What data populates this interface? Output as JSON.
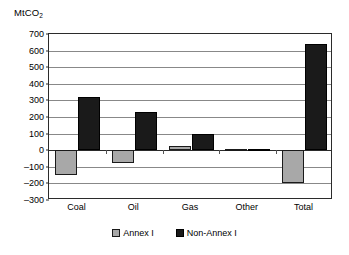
{
  "chart_data": {
    "type": "bar",
    "title": "",
    "subtitle": "",
    "xlabel": "",
    "ylabel": "MtCO2",
    "ylabel_prefix": "MtCO",
    "ylabel_sub": "2",
    "categories": [
      "Coal",
      "Oil",
      "Gas",
      "Other",
      "Total"
    ],
    "series": [
      {
        "name": "Annex I",
        "color": "#a8a8a8",
        "values": [
          -150,
          -75,
          25,
          5,
          -200
        ]
      },
      {
        "name": "Non-Annex I",
        "color": "#1a1a1a",
        "values": [
          320,
          230,
          95,
          5,
          640
        ]
      }
    ],
    "ylim": [
      -300,
      700
    ],
    "ytick_values": [
      700,
      600,
      500,
      400,
      300,
      200,
      100,
      0,
      -100,
      -200,
      -300
    ],
    "ytick_labels": [
      "700",
      "600",
      "500",
      "400",
      "300",
      "200",
      "100",
      "0",
      "–100",
      "–200",
      "–300"
    ],
    "grid": true,
    "grid_axis": "y",
    "legend_position": "bottom",
    "legend": [
      "Annex I",
      "Non-Annex I"
    ]
  },
  "axis": {
    "y_caption_prefix": "MtCO",
    "y_caption_sub": "2",
    "tick_0": "700",
    "tick_1": "600",
    "tick_2": "500",
    "tick_3": "400",
    "tick_4": "300",
    "tick_5": "200",
    "tick_6": "100",
    "tick_7": "0",
    "tick_8": "–100",
    "tick_9": "–200",
    "tick_10": "–300"
  },
  "xaxis": {
    "cat_0": "Coal",
    "cat_1": "Oil",
    "cat_2": "Gas",
    "cat_3": "Other",
    "cat_4": "Total"
  },
  "legend": {
    "item_0": "Annex I",
    "item_1": "Non-Annex I"
  }
}
